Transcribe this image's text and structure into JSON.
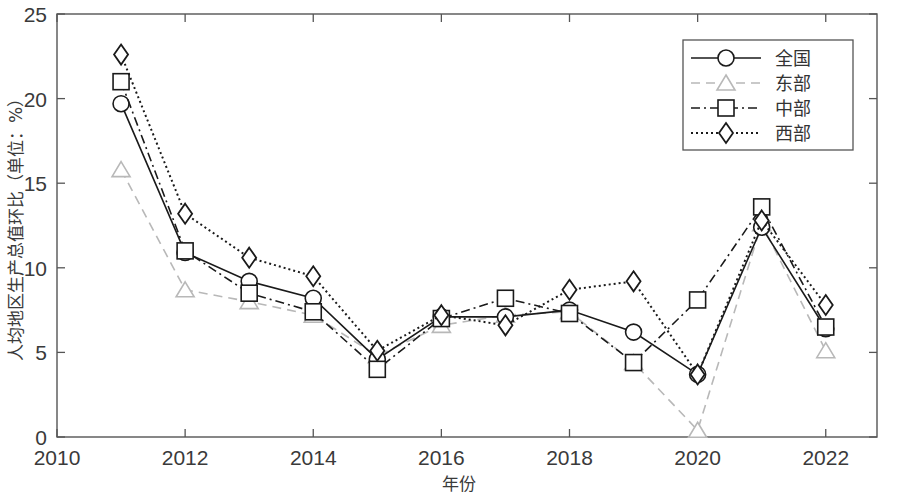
{
  "chart_data": {
    "type": "line",
    "title": "",
    "xlabel": "年份",
    "ylabel": "人均地区生产总值环比（单位：%）",
    "x": [
      2011,
      2012,
      2013,
      2014,
      2015,
      2016,
      2017,
      2018,
      2019,
      2020,
      2021,
      2022
    ],
    "xlim": [
      2010,
      2022.8
    ],
    "ylim": [
      0,
      25
    ],
    "xticks": [
      2010,
      2012,
      2014,
      2016,
      2018,
      2020,
      2022
    ],
    "xtick_labels": [
      "2010",
      "2012",
      "2014",
      "2016",
      "2018",
      "2020",
      "2022"
    ],
    "yticks": [
      0,
      5,
      10,
      15,
      20,
      25
    ],
    "ytick_labels": [
      "0",
      "5",
      "10",
      "15",
      "20",
      "25"
    ],
    "grid": false,
    "legend_position": "top-right",
    "series": [
      {
        "name": "全国",
        "marker": "circle",
        "linestyle": "solid",
        "color": "#1a1a1a",
        "values": [
          19.7,
          10.9,
          9.2,
          8.2,
          4.6,
          7.1,
          7.1,
          7.5,
          6.2,
          3.7,
          12.4,
          6.4
        ]
      },
      {
        "name": "东部",
        "marker": "triangle",
        "linestyle": "dashed",
        "color": "#b8b8b8",
        "values": [
          15.8,
          8.7,
          8.0,
          7.2,
          4.8,
          6.6,
          7.2,
          7.4,
          4.4,
          0.4,
          12.6,
          5.1
        ]
      },
      {
        "name": "中部",
        "marker": "square",
        "linestyle": "dashdot",
        "color": "#1a1a1a",
        "values": [
          21.0,
          11.0,
          8.5,
          7.4,
          4.0,
          7.0,
          8.2,
          7.3,
          4.4,
          8.1,
          13.6,
          6.5
        ]
      },
      {
        "name": "西部",
        "marker": "diamond",
        "linestyle": "dotted",
        "color": "#1a1a1a",
        "values": [
          22.6,
          13.2,
          10.6,
          9.5,
          5.1,
          7.2,
          6.6,
          8.7,
          9.2,
          3.7,
          12.8,
          7.8
        ]
      }
    ]
  },
  "legend": {
    "items": [
      {
        "label": "全国"
      },
      {
        "label": "东部"
      },
      {
        "label": "中部"
      },
      {
        "label": "西部"
      }
    ]
  },
  "axes": {
    "x_title": "年份",
    "y_title": "人均地区生产总值（单位：%）"
  }
}
